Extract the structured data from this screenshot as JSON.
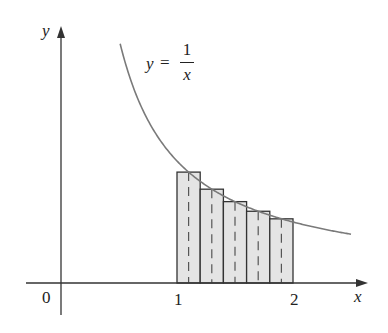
{
  "figure": {
    "type": "midpoint-riemann-sum",
    "function_label": {
      "lhs": "y",
      "eq": "=",
      "numerator": "1",
      "denominator": "x"
    },
    "axis_labels": {
      "x": "x",
      "y": "y"
    },
    "tick_labels": {
      "origin": "0",
      "x1": "1",
      "x2": "2"
    },
    "colors": {
      "curve": "#7a7a7a",
      "axes": "#333333",
      "rect_fill": "#e4e4e4",
      "rect_stroke": "#333333",
      "dash": "#555555"
    }
  },
  "chart_data": {
    "type": "area",
    "xlabel": "x",
    "ylabel": "y",
    "function": "1/x",
    "curve_domain": [
      0.51,
      2.5
    ],
    "interval": [
      1,
      2
    ],
    "n_rectangles": 5,
    "rectangle_width": 0.2,
    "rectangles": [
      {
        "x_left": 1.0,
        "x_right": 1.2,
        "midpoint": 1.1,
        "height": 0.909
      },
      {
        "x_left": 1.2,
        "x_right": 1.4,
        "midpoint": 1.3,
        "height": 0.769
      },
      {
        "x_left": 1.4,
        "x_right": 1.6,
        "midpoint": 1.5,
        "height": 0.667
      },
      {
        "x_left": 1.6,
        "x_right": 1.8,
        "midpoint": 1.7,
        "height": 0.588
      },
      {
        "x_left": 1.8,
        "x_right": 2.0,
        "midpoint": 1.9,
        "height": 0.526
      }
    ],
    "x_ticks": [
      0,
      1,
      2
    ],
    "grid": false
  }
}
